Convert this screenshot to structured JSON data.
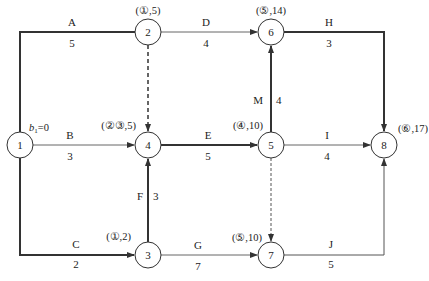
{
  "diagram": {
    "type": "activity-on-arrow network (double-code network diagram)",
    "nodes": [
      {
        "id": "1",
        "label": "1",
        "x": 20,
        "y": 145,
        "annotation": "b₁=0"
      },
      {
        "id": "2",
        "label": "2",
        "x": 148,
        "y": 32,
        "annotation": "(①,5)"
      },
      {
        "id": "3",
        "label": "3",
        "x": 148,
        "y": 255,
        "annotation": "(①,2)"
      },
      {
        "id": "4",
        "label": "4",
        "x": 148,
        "y": 145,
        "annotation": "(②③,5)"
      },
      {
        "id": "5",
        "label": "5",
        "x": 271,
        "y": 145,
        "annotation": "(④,10)"
      },
      {
        "id": "6",
        "label": "6",
        "x": 271,
        "y": 32,
        "annotation": "(⑤,14)"
      },
      {
        "id": "7",
        "label": "7",
        "x": 271,
        "y": 255,
        "annotation": "(⑤,10)"
      },
      {
        "id": "8",
        "label": "8",
        "x": 384,
        "y": 145,
        "annotation": "(⑥,17)"
      }
    ],
    "activities": [
      {
        "name": "A",
        "from": "1",
        "to": "2",
        "duration": "5",
        "style": "critical"
      },
      {
        "name": "B",
        "from": "1",
        "to": "4",
        "duration": "3",
        "style": "normal"
      },
      {
        "name": "C",
        "from": "1",
        "to": "3",
        "duration": "2",
        "style": "critical"
      },
      {
        "name": "D",
        "from": "2",
        "to": "6",
        "duration": "4",
        "style": "normal"
      },
      {
        "name": "E",
        "from": "4",
        "to": "5",
        "duration": "5",
        "style": "critical"
      },
      {
        "name": "F",
        "from": "3",
        "to": "4",
        "duration": "3",
        "style": "critical"
      },
      {
        "name": "G",
        "from": "3",
        "to": "7",
        "duration": "7",
        "style": "normal"
      },
      {
        "name": "H",
        "from": "6",
        "to": "8",
        "duration": "3",
        "style": "critical"
      },
      {
        "name": "I",
        "from": "5",
        "to": "8",
        "duration": "4",
        "style": "normal"
      },
      {
        "name": "J",
        "from": "7",
        "to": "8",
        "duration": "5",
        "style": "normal"
      },
      {
        "name": "M",
        "from": "5",
        "to": "6",
        "duration": "4",
        "style": "critical"
      },
      {
        "name": "",
        "from": "2",
        "to": "4",
        "duration": "",
        "style": "dummy"
      },
      {
        "name": "",
        "from": "5",
        "to": "7",
        "duration": "",
        "style": "dummy"
      }
    ],
    "colors": {
      "line": "#333333",
      "thin_line": "#555555",
      "text": "#222222",
      "background": "#ffffff"
    }
  },
  "labels": {
    "n1": "1",
    "n2": "2",
    "n3": "3",
    "n4": "4",
    "n5": "5",
    "n6": "6",
    "n7": "7",
    "n8": "8",
    "ann1_b": "b",
    "ann1_sub": "1",
    "ann1_rest": "=0",
    "ann2": "(①,5)",
    "ann3": "(①,2)",
    "ann4": "(②③,5)",
    "ann5": "(④,10)",
    "ann6": "(⑤,14)",
    "ann7": "(⑤,10)",
    "ann8": "(⑥,17)",
    "A": "A",
    "A_d": "5",
    "B": "B",
    "B_d": "3",
    "C": "C",
    "C_d": "2",
    "D": "D",
    "D_d": "4",
    "E": "E",
    "E_d": "5",
    "F": "F",
    "F_d": "3",
    "G": "G",
    "G_d": "7",
    "H": "H",
    "H_d": "3",
    "I": "I",
    "I_d": "4",
    "J": "J",
    "J_d": "5",
    "M": "M",
    "M_d": "4"
  }
}
